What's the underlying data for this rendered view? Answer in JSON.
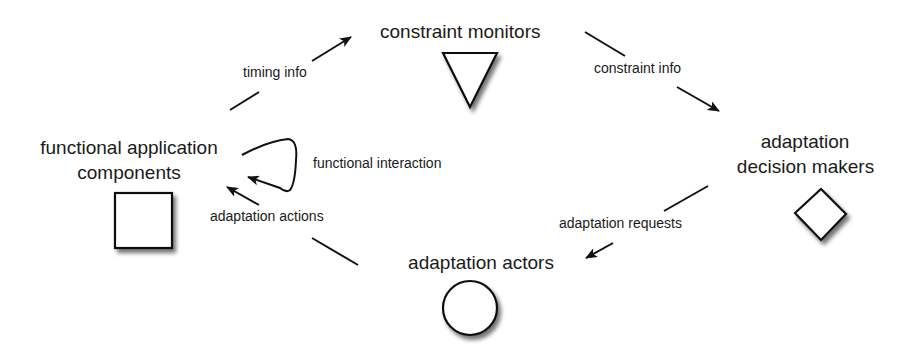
{
  "nodes": {
    "constraint_monitors": {
      "label": "constraint monitors",
      "shape": "triangle-down"
    },
    "decision_makers": {
      "line1": "adaptation",
      "line2": "decision makers",
      "shape": "diamond"
    },
    "actors": {
      "label": "adaptation actors",
      "shape": "circle"
    },
    "components": {
      "line1": "functional application",
      "line2": "components",
      "shape": "square"
    }
  },
  "edges": {
    "timing_info": {
      "label": "timing info",
      "from": "functional application components",
      "to": "constraint monitors"
    },
    "constraint_info": {
      "label": "constraint info",
      "from": "constraint monitors",
      "to": "adaptation decision makers"
    },
    "adaptation_requests": {
      "label": "adaptation requests",
      "from": "adaptation decision makers",
      "to": "adaptation actors"
    },
    "adaptation_actions": {
      "label": "adaptation actions",
      "from": "adaptation actors",
      "to": "functional application components"
    },
    "functional_interaction": {
      "label": "functional interaction",
      "from": "functional application components",
      "to": "functional application components"
    }
  },
  "colors": {
    "stroke": "#111111",
    "text": "#1a1a1a",
    "background": "#ffffff",
    "shadow": "#9a9a9a"
  }
}
